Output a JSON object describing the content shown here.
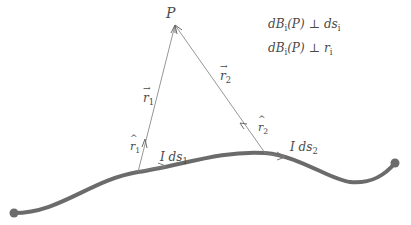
{
  "diagram": {
    "colors": {
      "wire": "#6b6b6b",
      "vector_lines": "#8a8a8a",
      "text": "#4a4a4a",
      "background": "#ffffff"
    },
    "point": {
      "label": "P",
      "x": 175,
      "y": 25
    },
    "wire": {
      "start": {
        "x": 14,
        "y": 213
      },
      "end": {
        "x": 395,
        "y": 163
      }
    },
    "vectors": [
      {
        "name": "r1",
        "label": "r",
        "subscript": "1",
        "from": {
          "x": 138,
          "y": 172
        },
        "to": {
          "x": 175,
          "y": 25
        },
        "unit_label": "r",
        "unit_subscript": "1",
        "element_label": "I ds",
        "element_subscript": "1"
      },
      {
        "name": "r2",
        "label": "r",
        "subscript": "2",
        "from": {
          "x": 265,
          "y": 153
        },
        "to": {
          "x": 175,
          "y": 25
        },
        "unit_label": "r",
        "unit_subscript": "2",
        "element_label": "I ds",
        "element_subscript": "2"
      }
    ],
    "equations": [
      {
        "lhs": "dB",
        "lhs_sub": "i",
        "arg": "(P)",
        "op": "⊥",
        "rhs": "ds",
        "rhs_sub": "i"
      },
      {
        "lhs": "dB",
        "lhs_sub": "i",
        "arg": "(P)",
        "op": "⊥",
        "rhs": "r",
        "rhs_sub": "i"
      }
    ]
  }
}
